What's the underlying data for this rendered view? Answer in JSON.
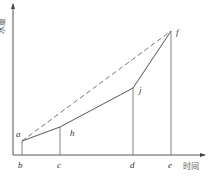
{
  "axes": {
    "x_label": "时间",
    "y_label": "水量"
  },
  "points": {
    "a": {
      "label": "a",
      "x": 22,
      "y": 141
    },
    "h": {
      "label": "h",
      "x": 60,
      "y": 127
    },
    "j": {
      "label": "j",
      "x": 133,
      "y": 88
    },
    "f": {
      "label": "f",
      "x": 171,
      "y": 31
    }
  },
  "ticks": [
    {
      "label": "b",
      "x": 22
    },
    {
      "label": "c",
      "x": 60
    },
    {
      "label": "d",
      "x": 133
    },
    {
      "label": "e",
      "x": 171
    }
  ],
  "colors": {
    "line": "#555555",
    "dash": "#666666"
  }
}
